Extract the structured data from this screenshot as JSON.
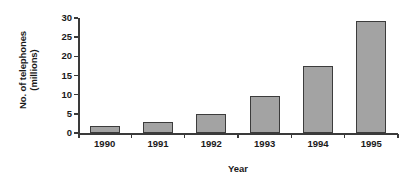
{
  "chart_data": {
    "type": "bar",
    "title": "",
    "xlabel": "Year",
    "ylabel": "No. of telephones (millions)",
    "ylabel_line1": "No. of telephones",
    "ylabel_line2": "(millions)",
    "categories": [
      "1990",
      "1991",
      "1992",
      "1993",
      "1994",
      "1995"
    ],
    "values": [
      1.8,
      2.9,
      5.0,
      9.7,
      17.5,
      29.2
    ],
    "series": [
      {
        "name": "No. of telephones (millions)",
        "values": [
          1.8,
          2.9,
          5.0,
          9.7,
          17.5,
          29.2
        ]
      }
    ],
    "ylim": [
      0,
      30
    ],
    "y_ticks": [
      0,
      5,
      10,
      15,
      20,
      25,
      30
    ],
    "y_tick_labels": [
      "0",
      "5",
      "10",
      "15",
      "20",
      "25",
      "30"
    ],
    "grid": false,
    "legend": false,
    "legend_position": "none",
    "bar_fill_color": "#a3a3a3",
    "bar_edge_color": "#3c3c3c",
    "axis_color": "#3a3a3a",
    "background_color": "#ffffff"
  }
}
